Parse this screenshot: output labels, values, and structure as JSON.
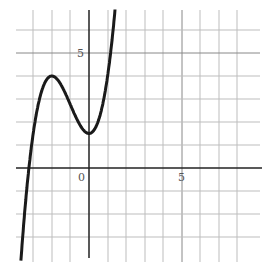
{
  "chart_data": {
    "type": "line",
    "title": "",
    "xlabel": "",
    "ylabel": "",
    "tick_labels": {
      "origin": "0",
      "x": "5",
      "y": "5"
    },
    "xlim": [
      -3.8,
      9.5
    ],
    "ylim": [
      -4.5,
      7
    ],
    "grid": true,
    "series": [
      {
        "name": "f(x)",
        "formula": "0.625*(x^3+3x^2)+1.5",
        "points": [
          [
            -3.25,
            0
          ],
          [
            -3,
            1.5
          ],
          [
            -2,
            4.0
          ],
          [
            -1,
            2.75
          ],
          [
            0,
            1.5
          ],
          [
            0.5,
            2.6
          ],
          [
            1,
            4.0
          ],
          [
            1.5,
            5.8
          ]
        ]
      }
    ]
  }
}
